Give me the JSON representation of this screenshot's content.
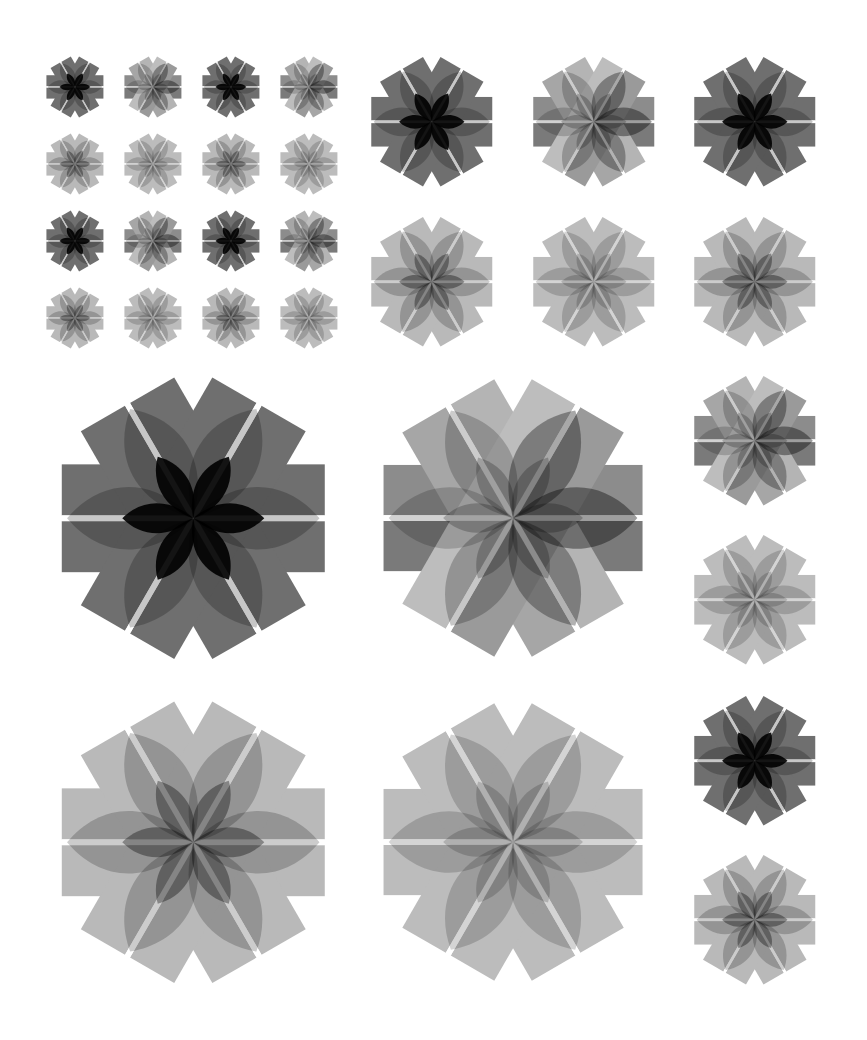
{
  "page": {
    "background": "#ffffff",
    "width": 867,
    "height": 1040
  },
  "styles": {
    "dark": {
      "bars": [
        "#6f6f6f",
        "#6f6f6f",
        "#6f6f6f",
        "#6f6f6f",
        "#6f6f6f",
        "#6f6f6f"
      ],
      "bar_opacity": 1,
      "petal_color": "#000000",
      "petal_opacity": [
        0.22,
        0.22,
        0.22,
        0.22,
        0.22,
        0.22
      ],
      "inner_color": "#000000",
      "inner_opacity": 0.9
    },
    "gradient": {
      "bars": [
        "#8c8c8c",
        "#7a7a7a",
        "#b4b4b4",
        "#a6a6a6",
        "#9a9a9a",
        "#bdbdbd"
      ],
      "bar_opacity": 1,
      "petal_color": "#000000",
      "petal_opacity": [
        0.38,
        0.3,
        0.22,
        0.18,
        0.2,
        0.34
      ],
      "inner_color": "#000000",
      "inner_opacity": 0.22
    },
    "light": {
      "bars": [
        "#b9b9b9",
        "#b9b9b9",
        "#b9b9b9",
        "#b9b9b9",
        "#b9b9b9",
        "#b9b9b9"
      ],
      "bar_opacity": 1,
      "petal_color": "#000000",
      "petal_opacity": [
        0.2,
        0.2,
        0.2,
        0.2,
        0.2,
        0.2
      ],
      "inner_color": "#000000",
      "inner_opacity": 0.35
    },
    "lighter": {
      "bars": [
        "#bcbcbc",
        "#bcbcbc",
        "#bcbcbc",
        "#bcbcbc",
        "#bcbcbc",
        "#bcbcbc"
      ],
      "bar_opacity": 1,
      "petal_color": "#000000",
      "petal_opacity": [
        0.17,
        0.17,
        0.17,
        0.17,
        0.17,
        0.17
      ],
      "inner_color": "#000000",
      "inner_opacity": 0.17
    }
  },
  "figures": [
    {
      "id": "small-1-1",
      "cx": 75,
      "cy": 87,
      "w": 57,
      "style": "dark"
    },
    {
      "id": "small-1-2",
      "cx": 153,
      "cy": 87,
      "w": 57,
      "style": "gradient"
    },
    {
      "id": "small-1-3",
      "cx": 231,
      "cy": 87,
      "w": 57,
      "style": "dark"
    },
    {
      "id": "small-1-4",
      "cx": 309,
      "cy": 87,
      "w": 57,
      "style": "gradient"
    },
    {
      "id": "small-2-1",
      "cx": 75,
      "cy": 164,
      "w": 57,
      "style": "light"
    },
    {
      "id": "small-2-2",
      "cx": 153,
      "cy": 164,
      "w": 57,
      "style": "lighter"
    },
    {
      "id": "small-2-3",
      "cx": 231,
      "cy": 164,
      "w": 57,
      "style": "light"
    },
    {
      "id": "small-2-4",
      "cx": 309,
      "cy": 164,
      "w": 57,
      "style": "lighter"
    },
    {
      "id": "small-3-1",
      "cx": 75,
      "cy": 241,
      "w": 57,
      "style": "dark"
    },
    {
      "id": "small-3-2",
      "cx": 153,
      "cy": 241,
      "w": 57,
      "style": "gradient"
    },
    {
      "id": "small-3-3",
      "cx": 231,
      "cy": 241,
      "w": 57,
      "style": "dark"
    },
    {
      "id": "small-3-4",
      "cx": 309,
      "cy": 241,
      "w": 57,
      "style": "gradient"
    },
    {
      "id": "small-4-1",
      "cx": 75,
      "cy": 318,
      "w": 57,
      "style": "light"
    },
    {
      "id": "small-4-2",
      "cx": 153,
      "cy": 318,
      "w": 57,
      "style": "lighter"
    },
    {
      "id": "small-4-3",
      "cx": 231,
      "cy": 318,
      "w": 57,
      "style": "light"
    },
    {
      "id": "small-4-4",
      "cx": 309,
      "cy": 318,
      "w": 57,
      "style": "lighter"
    },
    {
      "id": "medium-1-1",
      "cx": 432,
      "cy": 122,
      "w": 121,
      "style": "dark"
    },
    {
      "id": "medium-1-2",
      "cx": 594,
      "cy": 122,
      "w": 121,
      "style": "gradient"
    },
    {
      "id": "medium-1-3",
      "cx": 755,
      "cy": 122,
      "w": 121,
      "style": "dark"
    },
    {
      "id": "medium-2-1",
      "cx": 432,
      "cy": 282,
      "w": 121,
      "style": "light"
    },
    {
      "id": "medium-2-2",
      "cx": 594,
      "cy": 282,
      "w": 121,
      "style": "lighter"
    },
    {
      "id": "medium-2-3",
      "cx": 755,
      "cy": 282,
      "w": 121,
      "style": "light"
    },
    {
      "id": "large-1-1",
      "cx": 193,
      "cy": 518,
      "w": 263,
      "style": "dark"
    },
    {
      "id": "large-1-2",
      "cx": 513,
      "cy": 518,
      "w": 259,
      "style": "gradient"
    },
    {
      "id": "large-2-1",
      "cx": 193,
      "cy": 842,
      "w": 263,
      "style": "light"
    },
    {
      "id": "large-2-2",
      "cx": 513,
      "cy": 842,
      "w": 259,
      "style": "lighter"
    },
    {
      "id": "side-1",
      "cx": 755,
      "cy": 441,
      "w": 121,
      "style": "gradient"
    },
    {
      "id": "side-2",
      "cx": 755,
      "cy": 600,
      "w": 121,
      "style": "lighter"
    },
    {
      "id": "side-3",
      "cx": 755,
      "cy": 761,
      "w": 121,
      "style": "dark"
    },
    {
      "id": "side-4",
      "cx": 755,
      "cy": 920,
      "w": 121,
      "style": "light"
    }
  ],
  "geometry": {
    "bar_half_height": 0.205,
    "bar_gap_half": 0.011,
    "bar_angles": [
      0,
      60,
      120
    ],
    "petal_angles": [
      0,
      60,
      120,
      180,
      240,
      300
    ],
    "petal_length": 0.5,
    "petal_half_width": 0.115,
    "inner_length": 0.27,
    "inner_half_width": 0.055
  }
}
